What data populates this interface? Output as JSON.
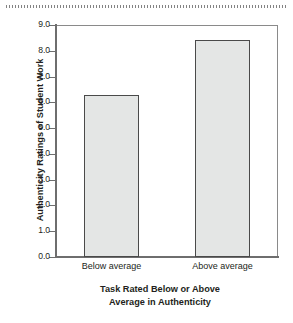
{
  "figure": {
    "top_rule_name": "page-edge-dotted-rule"
  },
  "chart_data": {
    "type": "bar",
    "title": "",
    "categories": [
      "Below average",
      "Above average"
    ],
    "values": [
      6.3,
      8.4
    ],
    "series": [
      {
        "name": "Authenticity Ratings of Student Work",
        "values": [
          6.3,
          8.4
        ]
      }
    ],
    "xlabel": "Task Rated Below or Above Average in Authenticity",
    "xlabel_line1": "Task Rated Below or Above",
    "xlabel_line2": "Average in Authenticity",
    "ylabel": "Authenticity Ratings of Student Work",
    "ylim": [
      0.0,
      9.0
    ],
    "ytick_values": [
      0.0,
      1.0,
      2.0,
      3.0,
      4.0,
      5.0,
      6.0,
      7.0,
      8.0,
      9.0
    ],
    "ytick_labels": [
      "0.0",
      "1.0",
      "2.0",
      "3.0",
      "4.0",
      "5.0",
      "6.0",
      "7.0",
      "8.0",
      "9.0"
    ],
    "grid": false,
    "legend": "none",
    "bar_fill_color": "#e4e6e5",
    "bar_edge_color": "#4a4a4a",
    "axis_color": "#6e6e6e",
    "text_color": "#231f20"
  }
}
